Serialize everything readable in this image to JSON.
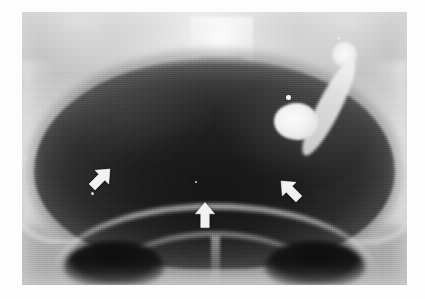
{
  "figure": {
    "modality": "X-ray",
    "view": "anteroposterior pelvis",
    "plate": {
      "left_px": 22,
      "top_px": 12,
      "width_px": 385,
      "height_px": 273,
      "background_color": "#c6c6c6"
    },
    "page_background_color": "#ffffff"
  },
  "annotations": {
    "arrow_color": "#f2f2f2",
    "items": [
      {
        "id": "arrow-left",
        "label": "left arrow marker",
        "direction": "up-right",
        "rotation_deg": 45,
        "x_px": 86,
        "y_px": 163
      },
      {
        "id": "arrow-center",
        "label": "center arrow marker",
        "direction": "up",
        "rotation_deg": 0,
        "x_px": 190,
        "y_px": 200
      },
      {
        "id": "arrow-right",
        "label": "right arrow marker",
        "direction": "up-left",
        "rotation_deg": -45,
        "x_px": 275,
        "y_px": 175
      }
    ]
  },
  "radiographic_features": [
    {
      "id": "dark-pelvic-mass",
      "label": "large rounded radiolucent pelvic mass",
      "density": "dark"
    },
    {
      "id": "sacrum",
      "label": "sacrum and lower lumbar spine",
      "density": "bright"
    },
    {
      "id": "iliac-wing-left",
      "label": "left iliac wing",
      "density": "bright"
    },
    {
      "id": "iliac-wing-right",
      "label": "right iliac wing",
      "density": "bright"
    },
    {
      "id": "pubic-rami",
      "label": "pubic rami arch",
      "density": "bright"
    },
    {
      "id": "obturator-foramen-left",
      "label": "left obturator foramen",
      "density": "dark"
    },
    {
      "id": "obturator-foramen-right",
      "label": "right obturator foramen",
      "density": "dark"
    },
    {
      "id": "contrast-tube",
      "label": "contrast-filled tubular structure",
      "density": "very bright"
    },
    {
      "id": "contrast-collection",
      "label": "rounded contrast collection",
      "density": "very bright"
    }
  ],
  "caption": {
    "text": "",
    "color": "#d8d8d8"
  }
}
